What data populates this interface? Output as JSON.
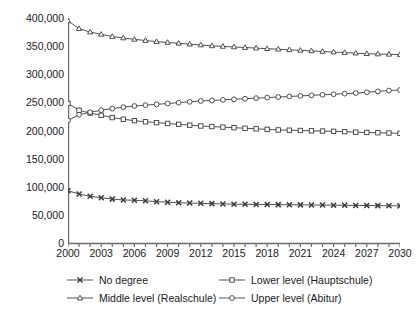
{
  "chart_data": {
    "type": "line",
    "title": "",
    "subtitle": "",
    "xlabel": "",
    "ylabel": "",
    "grid": false,
    "legend_position": "bottom",
    "x": [
      2000,
      2001,
      2002,
      2003,
      2004,
      2005,
      2006,
      2007,
      2008,
      2009,
      2010,
      2011,
      2012,
      2013,
      2014,
      2015,
      2016,
      2017,
      2018,
      2019,
      2020,
      2021,
      2022,
      2023,
      2024,
      2025,
      2026,
      2027,
      2028,
      2029,
      2030
    ],
    "categories": [
      "2000",
      "2001",
      "2002",
      "2003",
      "2004",
      "2005",
      "2006",
      "2007",
      "2008",
      "2009",
      "2010",
      "2011",
      "2012",
      "2013",
      "2014",
      "2015",
      "2016",
      "2017",
      "2018",
      "2019",
      "2020",
      "2021",
      "2022",
      "2023",
      "2024",
      "2025",
      "2026",
      "2027",
      "2028",
      "2029",
      "2030"
    ],
    "xlim": [
      2000,
      2030
    ],
    "ylim": [
      0,
      400000
    ],
    "xticks": [
      2000,
      2001,
      2002,
      2003,
      2004,
      2005,
      2006,
      2007,
      2008,
      2009,
      2010,
      2011,
      2012,
      2013,
      2014,
      2015,
      2016,
      2017,
      2018,
      2019,
      2020,
      2021,
      2022,
      2023,
      2024,
      2025,
      2026,
      2027,
      2028,
      2029,
      2030
    ],
    "xtick_labels": [
      "2000",
      "2003",
      "2006",
      "2009",
      "2012",
      "2015",
      "2018",
      "2021",
      "2024",
      "2027",
      "2030"
    ],
    "xtick_label_values": [
      2000,
      2003,
      2006,
      2009,
      2012,
      2015,
      2018,
      2021,
      2024,
      2027,
      2030
    ],
    "yticks": [
      0,
      50000,
      100000,
      150000,
      200000,
      250000,
      300000,
      350000,
      400000
    ],
    "ytick_labels": [
      "0",
      "50,000",
      "100,000",
      "150,000",
      "200,000",
      "250,000",
      "300,000",
      "350,000",
      "400,000"
    ],
    "series": [
      {
        "name": "No degree",
        "marker": "x",
        "values": [
          93000,
          87000,
          83000,
          80500,
          78000,
          76500,
          76000,
          75000,
          73500,
          72500,
          71500,
          71000,
          70500,
          70000,
          69500,
          69000,
          68800,
          68600,
          68400,
          68200,
          68000,
          67800,
          67600,
          67400,
          67200,
          67000,
          66800,
          66600,
          66400,
          66200,
          66000
        ]
      },
      {
        "name": "Lower level (Hauptschule)",
        "marker": "square",
        "values": [
          248000,
          236000,
          231000,
          227000,
          223000,
          220000,
          217500,
          215500,
          214000,
          212500,
          211000,
          209500,
          208000,
          207000,
          206000,
          205000,
          204000,
          203000,
          202000,
          201000,
          200500,
          200000,
          199500,
          199000,
          198500,
          198000,
          197000,
          196500,
          196000,
          195500,
          195000
        ]
      },
      {
        "name": "Middle level (Realschule)",
        "marker": "triangle",
        "values": [
          395000,
          381000,
          375000,
          371000,
          367000,
          364500,
          362000,
          360000,
          358000,
          356500,
          355000,
          353500,
          352000,
          350500,
          349500,
          348500,
          347500,
          346500,
          345500,
          344500,
          343500,
          342500,
          341500,
          340500,
          339500,
          338500,
          337500,
          336500,
          336000,
          335500,
          335000
        ]
      },
      {
        "name": "Upper level (Abitur)",
        "marker": "circle",
        "values": [
          218000,
          228000,
          232500,
          236000,
          239000,
          241500,
          243500,
          245000,
          246500,
          248000,
          249500,
          251000,
          252500,
          253500,
          254500,
          255500,
          256500,
          257500,
          258500,
          259500,
          260500,
          261500,
          262500,
          263500,
          264500,
          265500,
          266500,
          268000,
          269500,
          271000,
          272000
        ]
      }
    ]
  },
  "legend": {
    "items": [
      {
        "label": "No degree",
        "marker": "x"
      },
      {
        "label": "Middle level (Realschule)",
        "marker": "triangle"
      },
      {
        "label": "Lower level (Hauptschule)",
        "marker": "square"
      },
      {
        "label": "Upper level (Abitur)",
        "marker": "circle"
      }
    ]
  },
  "colors": {
    "axis": "#6b6b6b",
    "line": "#3c3c3c",
    "text": "#1a1a1a",
    "background": "#ffffff"
  }
}
